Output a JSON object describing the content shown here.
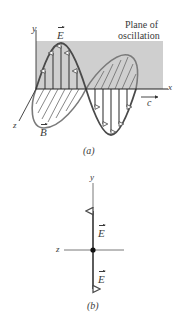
{
  "figure_a": {
    "caption": "(a)",
    "plane_label_line1": "Plane of",
    "plane_label_line2": "oscillation",
    "axis_x": "x",
    "axis_y": "y",
    "axis_z": "z",
    "e_field_label": "E",
    "b_field_label": "B",
    "speed_label": "c",
    "colors": {
      "plane": "#cfcfcf",
      "wave": "#4a4a4a",
      "arrows": "#4a4a4a",
      "axes": "#333333"
    }
  },
  "figure_b": {
    "caption": "(b)",
    "axis_y": "y",
    "axis_z": "z",
    "e_up_label": "E",
    "e_down_label": "E"
  }
}
